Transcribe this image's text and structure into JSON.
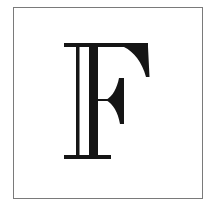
{
  "tile": {
    "letter": "F",
    "style": "inline-double-stroke serif capital",
    "ink_color": "#151515",
    "border_color": "#7a7a7a",
    "background_color": "#ffffff"
  }
}
